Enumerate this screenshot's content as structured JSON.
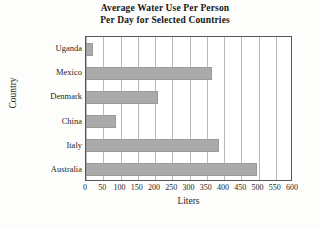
{
  "chart_data": {
    "type": "bar",
    "orientation": "horizontal",
    "title": "Average Water Use Per Person Per Day for Selected Countries",
    "title_lines": [
      "Average Water Use Per Person",
      "Per Day for Selected Countries"
    ],
    "categories": [
      "Uganda",
      "Mexico",
      "Denmark",
      "China",
      "Italy",
      "Australia"
    ],
    "values": [
      20,
      365,
      210,
      88,
      385,
      495
    ],
    "xlabel": "Liters",
    "ylabel": "Country",
    "xlim": [
      0,
      600
    ],
    "xticks": [
      0,
      50,
      100,
      150,
      200,
      250,
      300,
      350,
      400,
      450,
      500,
      550,
      600
    ],
    "xtick_labels": [
      "0",
      "50",
      "100",
      "150",
      "200",
      "250",
      "300",
      "350",
      "400",
      "450",
      "500",
      "550",
      "600"
    ],
    "grid": "vertical",
    "legend": null,
    "bar_color": "#aaaaaa",
    "frame_color": "#555555",
    "gridline_color": "#b8b8b8",
    "background_color": "#ffffff"
  }
}
